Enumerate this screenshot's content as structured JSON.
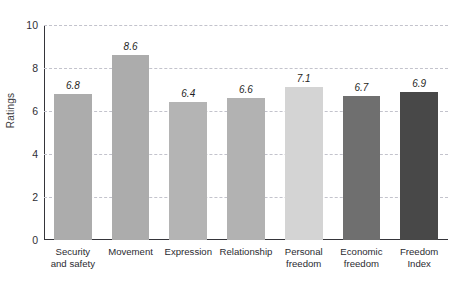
{
  "chart_data": {
    "type": "bar",
    "title": "",
    "xlabel": "",
    "ylabel": "Ratings",
    "ylim": [
      0,
      10
    ],
    "yticks": [
      0,
      2,
      4,
      6,
      8,
      10
    ],
    "grid": true,
    "legend": false,
    "categories": [
      "Security\nand safety",
      "Movement",
      "Expression",
      "Relationship",
      "Personal\nfreedom",
      "Economic\nfreedom",
      "Freedom\nIndex"
    ],
    "values": [
      6.8,
      8.6,
      6.4,
      6.6,
      7.1,
      6.7,
      6.9
    ],
    "value_labels": [
      "6.8",
      "8.6",
      "6.4",
      "6.6",
      "7.1",
      "6.7",
      "6.9"
    ],
    "bar_colors": [
      "#acacac",
      "#acacac",
      "#b4b4b4",
      "#b2b2b2",
      "#d4d4d4",
      "#6f6f6f",
      "#484848"
    ]
  },
  "axes": {
    "y_tick_labels": [
      "0",
      "2",
      "4",
      "6",
      "8",
      "10"
    ],
    "y_axis_title": "Ratings"
  },
  "colors": {
    "axis": "#35353a",
    "gridline": "#c3c3cc",
    "text": "#2b2b31",
    "background": "#ffffff"
  }
}
